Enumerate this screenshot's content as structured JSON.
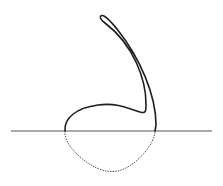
{
  "diagram": {
    "type": "line-drawing",
    "colors": {
      "background": "#ffffff",
      "outline": "#1e1e1e",
      "baseline": "#555555",
      "hidden_curve": "#3a3a3a"
    },
    "elements": [
      {
        "name": "baseline",
        "style": "solid",
        "from": [
          11,
          131
        ],
        "to": [
          212,
          131
        ]
      },
      {
        "name": "upper-outline",
        "style": "solid",
        "description": "bulb above baseline extending into a long curved stem ending in a rounded tip"
      },
      {
        "name": "lower-curve",
        "style": "dashed",
        "description": "rounded portion below baseline between x≈65 and x≈155"
      }
    ]
  }
}
